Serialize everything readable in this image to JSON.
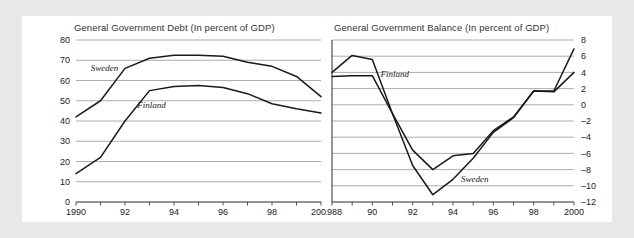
{
  "figure": {
    "background": "#e8e8e8",
    "panel_background": "#ffffff",
    "line_color": "#1a1a1a",
    "grid_color": "#8a8a8a"
  },
  "chart_data": [
    {
      "id": "general-government-debt",
      "type": "line",
      "title": "General Government Debt (In percent of GDP)",
      "xlabel": "",
      "ylabel": "",
      "xlim": [
        1990,
        2000
      ],
      "ylim": [
        0,
        80
      ],
      "yticks": [
        0,
        10,
        20,
        30,
        40,
        50,
        60,
        70,
        80
      ],
      "ytick_labels": [
        "0",
        "10",
        "20",
        "30",
        "40",
        "50",
        "60",
        "70",
        "80"
      ],
      "xticks": [
        1990,
        1991,
        1992,
        1993,
        1994,
        1995,
        1996,
        1997,
        1998,
        1999,
        2000
      ],
      "xtick_labels": [
        "1990",
        "",
        "92",
        "",
        "94",
        "",
        "96",
        "",
        "98",
        "",
        "2000"
      ],
      "grid": true,
      "legend": "inline-labels",
      "x": [
        1990,
        1991,
        1992,
        1993,
        1994,
        1995,
        1996,
        1997,
        1998,
        1999,
        2000
      ],
      "series": [
        {
          "name": "Sweden",
          "label_x": 1990.6,
          "label_y": 64.5,
          "values": [
            42,
            50,
            66,
            71,
            72.5,
            72.5,
            72,
            69,
            67,
            62,
            52
          ]
        },
        {
          "name": "Finland",
          "label_x": 1992.5,
          "label_y": 46.5,
          "values": [
            14,
            22,
            40,
            55,
            57,
            57.5,
            56.5,
            53.5,
            48.5,
            46,
            44
          ]
        }
      ]
    },
    {
      "id": "general-government-balance",
      "type": "line",
      "title": "General Government Balance (In percent of GDP)",
      "xlabel": "",
      "ylabel": "",
      "xlim": [
        1988,
        2000
      ],
      "ylim": [
        -12,
        8
      ],
      "yticks": [
        8,
        6,
        4,
        2,
        0,
        -2,
        -4,
        -6,
        -8,
        -10,
        -12
      ],
      "ytick_labels": [
        "8",
        "6",
        "4",
        "2",
        "0",
        "–2",
        "–4",
        "–6",
        "–8",
        "–10",
        "–12"
      ],
      "xticks": [
        1988,
        1989,
        1990,
        1991,
        1992,
        1993,
        1994,
        1995,
        1996,
        1997,
        1998,
        1999,
        2000
      ],
      "xtick_labels": [
        "1988",
        "",
        "90",
        "",
        "92",
        "",
        "94",
        "",
        "96",
        "",
        "98",
        "",
        "2000"
      ],
      "grid": true,
      "legend": "inline-labels",
      "x": [
        1988,
        1989,
        1990,
        1991,
        1992,
        1993,
        1994,
        1995,
        1996,
        1997,
        1998,
        1999,
        2000
      ],
      "series": [
        {
          "name": "Finland",
          "label_x": 1990.4,
          "label_y": 3.4,
          "values": [
            4,
            6.1,
            5.6,
            -1.1,
            -5.6,
            -8,
            -6.3,
            -6,
            -3.2,
            -1.5,
            1.7,
            1.7,
            6.9
          ]
        },
        {
          "name": "Sweden",
          "label_x": 1994.4,
          "label_y": -9.5,
          "values": [
            3.5,
            3.6,
            3.6,
            -1.1,
            -7.5,
            -11.1,
            -9.2,
            -6.6,
            -3.4,
            -1.6,
            1.7,
            1.6,
            4
          ]
        }
      ]
    }
  ]
}
